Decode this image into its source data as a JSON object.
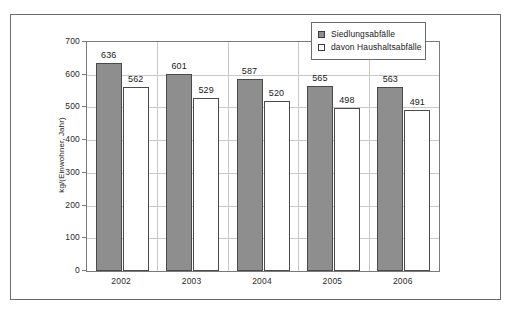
{
  "chart_data": {
    "type": "bar",
    "title": "",
    "subtitle": "",
    "xlabel": "",
    "ylabel": "kg/(Einwohner, Jahr)",
    "categories": [
      "2002",
      "2003",
      "2004",
      "2005",
      "2006"
    ],
    "series": [
      {
        "name": "Siedlungsabfälle",
        "values": [
          636,
          601,
          587,
          565,
          563
        ],
        "color": "#8e8e8e",
        "style": "filled"
      },
      {
        "name": "davon Haushaltsabfälle",
        "values": [
          562,
          529,
          520,
          498,
          491
        ],
        "color": "#ffffff",
        "style": "hollow"
      }
    ],
    "ylim": [
      0,
      700
    ],
    "yticks": [
      0,
      100,
      200,
      300,
      400,
      500,
      600,
      700
    ],
    "ytick_labels": [
      "0",
      "100",
      "200",
      "300",
      "400",
      "500",
      "600",
      "700"
    ],
    "grid": true,
    "grid_axis": "both",
    "legend_position": "top-right",
    "data_labels": true
  },
  "legend": {
    "entries": [
      {
        "label": "Siedlungsabfälle",
        "swatch": "filled"
      },
      {
        "label": "davon Haushaltsabfälle",
        "swatch": "hollow"
      }
    ]
  },
  "caption": {
    "text": ""
  }
}
